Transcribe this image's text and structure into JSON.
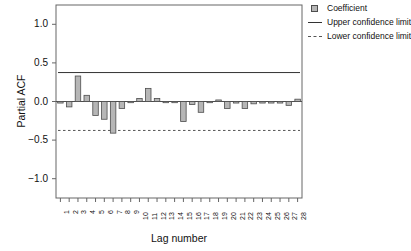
{
  "chart_data": {
    "type": "bar",
    "title": "",
    "xlabel": "Lag number",
    "ylabel": "Partial ACF",
    "ylim": [
      -1.25,
      1.25
    ],
    "yticks": [
      1.0,
      0.5,
      0.0,
      -0.5,
      -1.0
    ],
    "ytick_labels": [
      "1.0",
      "0.5",
      "0.0",
      "-0.5",
      "-1.0"
    ],
    "grid": false,
    "legend_position": "top-right",
    "categories": [
      1,
      2,
      3,
      4,
      5,
      6,
      7,
      8,
      9,
      10,
      11,
      12,
      13,
      14,
      15,
      16,
      17,
      18,
      19,
      20,
      21,
      22,
      23,
      24,
      25,
      26,
      27,
      28
    ],
    "xtick_labels": [
      "1",
      "2",
      "3",
      "4",
      "5",
      "6",
      "7",
      "8",
      "9",
      "10",
      "11",
      "12",
      "13",
      "14",
      "15",
      "16",
      "17",
      "18",
      "19",
      "20",
      "21",
      "22",
      "23",
      "24",
      "25",
      "26",
      "27",
      "28"
    ],
    "series": [
      {
        "name": "Coefficient",
        "values": [
          -0.02,
          -0.07,
          0.33,
          0.08,
          -0.18,
          -0.23,
          -0.41,
          -0.09,
          -0.01,
          0.04,
          0.17,
          0.04,
          -0.01,
          -0.005,
          -0.26,
          -0.04,
          -0.14,
          -0.005,
          0.02,
          -0.09,
          -0.02,
          -0.09,
          -0.03,
          -0.02,
          -0.02,
          -0.02,
          -0.05,
          0.03
        ]
      }
    ],
    "upper_confidence_limit": 0.375,
    "lower_confidence_limit": -0.375,
    "colors": {
      "bar_fill": "#b6b6b6",
      "bar_stroke": "#4d4d4d",
      "upper_limit_line": "#333333",
      "lower_limit_line": "#555555",
      "axis": "#666666",
      "background": "#ffffff"
    }
  },
  "legend": {
    "items": [
      {
        "label": "Coefficient",
        "key": "square-swatch-icon"
      },
      {
        "label": "Upper confidence limit",
        "key": "solid-line-icon"
      },
      {
        "label": "Lower confidence limit",
        "key": "dashed-line-icon"
      }
    ]
  }
}
